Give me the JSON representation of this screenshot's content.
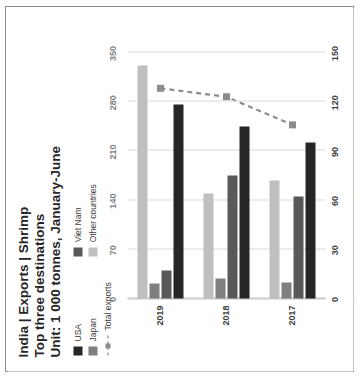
{
  "title": {
    "line1": "India | Exports | Shrimp",
    "line2": "Top three destinations",
    "line3": "Unit: 1 000 tonnes, January-June"
  },
  "source": "Source: Ministry of Commerce, India",
  "legend": {
    "col1": [
      {
        "label": "USA",
        "color": "#262626",
        "type": "swatch"
      },
      {
        "label": "Japan",
        "color": "#7f7f7f",
        "type": "swatch"
      },
      {
        "label": "Total exports",
        "color": "#8c8c8c",
        "type": "line"
      }
    ],
    "col2": [
      {
        "label": "Viet Nam",
        "color": "#595959",
        "type": "swatch"
      },
      {
        "label": "Other countries",
        "color": "#bfbfbf",
        "type": "swatch"
      }
    ]
  },
  "chart_data": {
    "type": "bar",
    "subtitle": "Unit: 1 000 tonnes, January-June",
    "orientation": "horizontal",
    "rotation_deg": -90,
    "xlabel": "",
    "ylabel": "1 000 tonnes",
    "categories": [
      "2017",
      "2018",
      "2019"
    ],
    "primary_axis": {
      "ticks": [
        0,
        30,
        60,
        90,
        120,
        150
      ],
      "lim": [
        0,
        150
      ],
      "position": "bottom"
    },
    "secondary_axis": {
      "ticks": [
        0,
        70,
        140,
        210,
        280,
        350
      ],
      "lim": [
        0,
        350
      ],
      "position": "top"
    },
    "grid": true,
    "legend_position": "top-left",
    "series": [
      {
        "name": "USA",
        "color": "#262626",
        "axis": "primary",
        "values": [
          95,
          105,
          118
        ]
      },
      {
        "name": "Viet Nam",
        "color": "#595959",
        "axis": "primary",
        "values": [
          62,
          75,
          17
        ]
      },
      {
        "name": "Japan",
        "color": "#7f7f7f",
        "axis": "primary",
        "values": [
          10,
          12,
          9
        ]
      },
      {
        "name": "Other countries",
        "color": "#bfbfbf",
        "axis": "primary",
        "values": [
          72,
          64,
          142
        ]
      },
      {
        "name": "Total exports",
        "color": "#8c8c8c",
        "axis": "secondary",
        "type": "line-dashed-marker",
        "values": [
          247,
          287,
          299
        ]
      }
    ]
  },
  "ticks_primary": [
    "0",
    "30",
    "60",
    "90",
    "120",
    "150"
  ],
  "ticks_secondary": [
    "0",
    "70",
    "140",
    "210",
    "280",
    "350"
  ],
  "year_labels": [
    "2017",
    "2018",
    "2019"
  ]
}
